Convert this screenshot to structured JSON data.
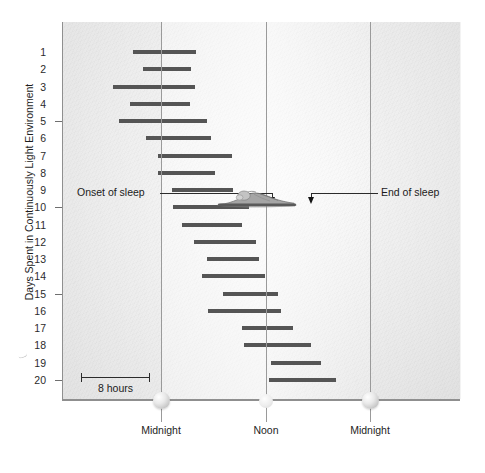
{
  "axes": {
    "y_title": "Days Spent in Continuously Light Environment",
    "y_ticks": [
      "1",
      "2",
      "3",
      "4",
      "5",
      "6",
      "7",
      "8",
      "9",
      "10",
      "11",
      "12",
      "13",
      "14",
      "15",
      "16",
      "17",
      "18",
      "19",
      "20"
    ],
    "x_labels": [
      "Midnight",
      "Noon",
      "Midnight"
    ]
  },
  "annotations": {
    "onset": "Onset of sleep",
    "end": "End of sleep",
    "scale": "8 hours"
  },
  "icons": {
    "left_midnight": "moon-icon",
    "noon": "sun-icon",
    "right_midnight": "moon-icon",
    "sleeper": "sleeping-person-icon"
  },
  "colors": {
    "bar": "#555555",
    "gridline": "#9a9a9a",
    "axis": "#8f8f8f",
    "text": "#1e1e1e",
    "panel_light": "#fbfbfb",
    "panel_dark": "#e6e6e6"
  },
  "chart_data": {
    "type": "bar",
    "title": "",
    "subtitle": "",
    "xlabel": "",
    "ylabel": "Days Spent in Continuously Light Environment",
    "grid": true,
    "legend": null,
    "orientation": "horizontal-span",
    "x_axis": {
      "unit": "hour of day",
      "range_hours": [
        -11.4,
        34.3
      ],
      "tick_hours": [
        0,
        12,
        24
      ],
      "tick_labels": [
        "Midnight",
        "Noon",
        "Midnight"
      ],
      "hours_per_pixel": 0.1148,
      "scale_bar_hours": 8
    },
    "y_axis": {
      "unit": "day",
      "categories": [
        1,
        2,
        3,
        4,
        5,
        6,
        7,
        8,
        9,
        10,
        11,
        12,
        13,
        14,
        15,
        16,
        17,
        18,
        18,
        20
      ],
      "ticks_shown": [
        5,
        10,
        15,
        20
      ],
      "range": [
        1,
        20
      ],
      "direction": "top-to-bottom"
    },
    "series": [
      {
        "name": "Sleep episode",
        "units": "hours after midnight",
        "bars": [
          {
            "day": 1,
            "start": -3.3,
            "end": 3.9,
            "start_px": 132,
            "end_px": 195
          },
          {
            "day": 2,
            "start": -2.2,
            "end": 3.3,
            "start_px": 142,
            "end_px": 190
          },
          {
            "day": 3,
            "start": -5.6,
            "end": 3.8,
            "start_px": 112,
            "end_px": 194
          },
          {
            "day": 4,
            "start": -3.7,
            "end": 3.2,
            "start_px": 129,
            "end_px": 189
          },
          {
            "day": 5,
            "start": -4.9,
            "end": 5.1,
            "start_px": 118,
            "end_px": 206
          },
          {
            "day": 6,
            "start": -1.8,
            "end": 5.6,
            "start_px": 145,
            "end_px": 210
          },
          {
            "day": 7,
            "start": -0.5,
            "end": 8.0,
            "start_px": 157,
            "end_px": 231
          },
          {
            "day": 8,
            "start": -0.5,
            "end": 6.0,
            "start_px": 157,
            "end_px": 214
          },
          {
            "day": 9,
            "start": 1.2,
            "end": 8.2,
            "start_px": 171,
            "end_px": 232
          },
          {
            "day": 10,
            "start": 1.3,
            "end": 10.0,
            "start_px": 172,
            "end_px": 248
          },
          {
            "day": 11,
            "start": 2.3,
            "end": 9.2,
            "start_px": 181,
            "end_px": 241
          },
          {
            "day": 12,
            "start": 3.7,
            "end": 10.8,
            "start_px": 193,
            "end_px": 255
          },
          {
            "day": 13,
            "start": 5.2,
            "end": 11.1,
            "start_px": 206,
            "end_px": 258
          },
          {
            "day": 14,
            "start": 4.6,
            "end": 11.9,
            "start_px": 201,
            "end_px": 264
          },
          {
            "day": 15,
            "start": 7.0,
            "end": 13.3,
            "start_px": 222,
            "end_px": 277
          },
          {
            "day": 16,
            "start": 5.3,
            "end": 13.7,
            "start_px": 207,
            "end_px": 280
          },
          {
            "day": 17,
            "start": 9.2,
            "end": 15.1,
            "start_px": 241,
            "end_px": 292
          },
          {
            "day": 18,
            "start": 9.4,
            "end": 17.1,
            "start_px": 243,
            "end_px": 310
          },
          {
            "day": 19,
            "start": 12.5,
            "end": 18.2,
            "start_px": 270,
            "end_px": 320
          },
          {
            "day": 20,
            "start": 12.3,
            "end": 20.0,
            "start_px": 268,
            "end_px": 335
          }
        ]
      }
    ],
    "annotations": [
      {
        "label": "Onset of sleep",
        "points_to_day": 10,
        "side": "left"
      },
      {
        "label": "End of sleep",
        "points_to_day": 10,
        "side": "right"
      },
      {
        "label": "8 hours",
        "type": "scale-bar"
      }
    ]
  }
}
